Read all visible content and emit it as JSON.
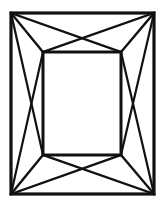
{
  "figure": {
    "background_color": "#ffffff",
    "line_color": "#111111",
    "canvas": {
      "width": 165,
      "height": 210
    },
    "geometry": {
      "outer_rect": {
        "x1": 11,
        "y1": 13,
        "x2": 154,
        "y2": 194
      },
      "inner_rect": {
        "x1": 43,
        "y1": 52,
        "x2": 121,
        "y2": 155
      },
      "outer_corners": {
        "top_left": [
          11,
          13
        ],
        "top_right": [
          154,
          13
        ],
        "bottom_right": [
          154,
          194
        ],
        "bottom_left": [
          11,
          194
        ]
      },
      "inner_corners": {
        "top_left": [
          43,
          52
        ],
        "top_right": [
          121,
          52
        ],
        "bottom_right": [
          121,
          155
        ],
        "bottom_left": [
          43,
          155
        ]
      },
      "corner_facets": [
        {
          "name": "top-left-facet",
          "from": [
            11,
            13
          ],
          "to": [
            43,
            52
          ]
        },
        {
          "name": "top-right-facet",
          "from": [
            154,
            13
          ],
          "to": [
            121,
            52
          ]
        },
        {
          "name": "bottom-right-facet",
          "from": [
            154,
            194
          ],
          "to": [
            121,
            155
          ]
        },
        {
          "name": "bottom-left-facet",
          "from": [
            11,
            194
          ],
          "to": [
            43,
            155
          ]
        }
      ],
      "band_diagonals": [
        {
          "name": "top-band-diagonal-a",
          "from": [
            11,
            13
          ],
          "to": [
            121,
            52
          ]
        },
        {
          "name": "top-band-diagonal-b",
          "from": [
            154,
            13
          ],
          "to": [
            43,
            52
          ]
        },
        {
          "name": "bottom-band-diagonal-a",
          "from": [
            11,
            194
          ],
          "to": [
            121,
            155
          ]
        },
        {
          "name": "bottom-band-diagonal-b",
          "from": [
            154,
            194
          ],
          "to": [
            43,
            155
          ]
        },
        {
          "name": "left-band-diagonal-a",
          "from": [
            11,
            13
          ],
          "to": [
            43,
            155
          ]
        },
        {
          "name": "left-band-diagonal-b",
          "from": [
            11,
            194
          ],
          "to": [
            43,
            52
          ]
        },
        {
          "name": "right-band-diagonal-a",
          "from": [
            154,
            13
          ],
          "to": [
            121,
            155
          ]
        },
        {
          "name": "right-band-diagonal-b",
          "from": [
            154,
            194
          ],
          "to": [
            121,
            52
          ]
        }
      ]
    }
  }
}
